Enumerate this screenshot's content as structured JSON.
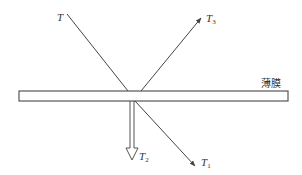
{
  "diagram": {
    "type": "force-diagram",
    "film": {
      "label": "薄膜"
    },
    "forces": [
      {
        "id": "T",
        "label_main": "T",
        "label_sub": "",
        "direction": "up-left"
      },
      {
        "id": "T3",
        "label_main": "T",
        "label_sub": "3",
        "direction": "up-right"
      },
      {
        "id": "T2",
        "label_main": "T",
        "label_sub": "2",
        "direction": "down"
      },
      {
        "id": "T1",
        "label_main": "T",
        "label_sub": "1",
        "direction": "down-right"
      }
    ],
    "colors": {
      "line": "#444444",
      "background": "#ffffff"
    }
  }
}
